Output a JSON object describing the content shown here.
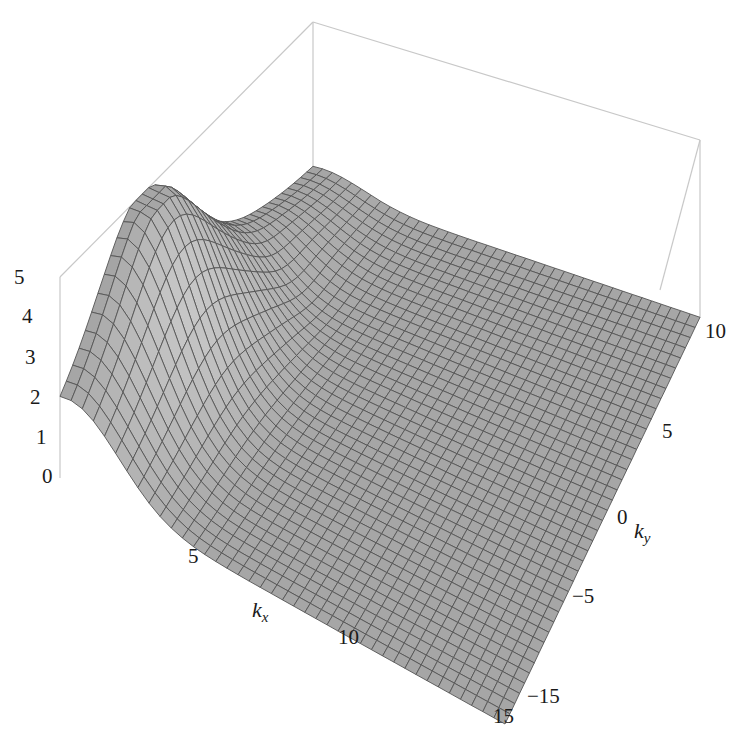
{
  "chart_data": {
    "type": "surface3d",
    "title": "",
    "xlabel": "k_x",
    "ylabel": "k_y",
    "zlabel": "",
    "xlabel_main": "k",
    "xlabel_sub": "x",
    "ylabel_main": "k",
    "ylabel_sub": "y",
    "xlim": [
      0,
      15
    ],
    "ylim": [
      -15,
      10
    ],
    "zlim": [
      0,
      5
    ],
    "x_ticks": [
      "5",
      "10",
      "15"
    ],
    "y_ticks": [
      "−15",
      "−5",
      "0",
      "5",
      "10"
    ],
    "z_ticks": [
      "0",
      "1",
      "2",
      "3",
      "4",
      "5"
    ],
    "grid_resolution": [
      40,
      40
    ],
    "surface": {
      "description": "Sharp ridge near k_x ≈ 0 peaking at ~4.9 near k_y ≈ -7, decaying toward 0 for large k_x; nearly flat elsewhere with a saddle/dip behind the ridge",
      "peak_value": 4.9,
      "peak_kx": 0.4,
      "peak_ky": -7,
      "ridge_width_kx": 1.6,
      "ridge_decay_ky": 6.5,
      "mesh_color": "#a6a6a6",
      "mesh_line_color": "#555555",
      "shadow_color": "#6e6e6e"
    },
    "box_color": "#c8c8c8",
    "grid": false,
    "legend": null
  }
}
